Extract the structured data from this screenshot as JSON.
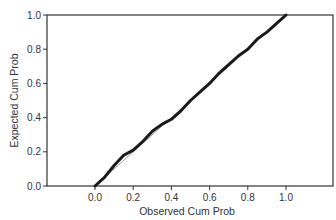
{
  "chart_data": {
    "type": "line",
    "title": "",
    "xlabel": "Observed Cum Prob",
    "ylabel": "Expected Cum Prob",
    "xlim": [
      -0.5,
      1.25
    ],
    "ylim": [
      0.0,
      1.0
    ],
    "x_ticks": [
      "0.0",
      "0.2",
      "0.4",
      "0.6",
      "0.8",
      "1.0"
    ],
    "y_ticks": [
      "0.0",
      "0.2",
      "0.4",
      "0.6",
      "0.8",
      "1.0"
    ],
    "grid": false,
    "legend": null,
    "series": [
      {
        "name": "observed",
        "x": [
          0.0,
          0.05,
          0.1,
          0.15,
          0.2,
          0.25,
          0.3,
          0.35,
          0.4,
          0.45,
          0.5,
          0.55,
          0.6,
          0.65,
          0.7,
          0.75,
          0.8,
          0.85,
          0.9,
          0.95,
          1.0
        ],
        "y": [
          0.0,
          0.05,
          0.12,
          0.18,
          0.21,
          0.26,
          0.32,
          0.36,
          0.39,
          0.44,
          0.5,
          0.55,
          0.6,
          0.66,
          0.71,
          0.76,
          0.8,
          0.86,
          0.9,
          0.95,
          1.0
        ]
      },
      {
        "name": "reference",
        "x": [
          0.0,
          1.0
        ],
        "y": [
          0.0,
          1.0
        ]
      }
    ]
  }
}
